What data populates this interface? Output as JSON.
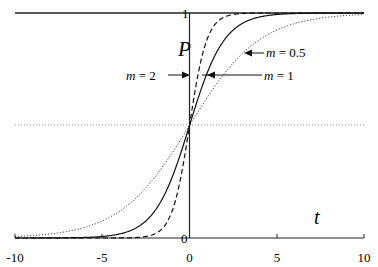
{
  "chart_data": {
    "type": "line",
    "title": "",
    "xlabel": "t",
    "ylabel": "P",
    "xlim": [
      -10,
      10
    ],
    "ylim": [
      0,
      1
    ],
    "x_ticks": [
      "-10",
      "-5",
      "0",
      "5",
      "10"
    ],
    "y_ticks": [
      "0",
      "1"
    ],
    "grid": false,
    "reference_line": {
      "y": 0.5,
      "style": "dotted"
    },
    "function": "P = 1 / (1 + exp(-m t))",
    "series": [
      {
        "name": "m = 0.5",
        "m": 0.5,
        "style": "dotted",
        "x": [
          -10,
          -8,
          -6,
          -4,
          -2,
          0,
          2,
          4,
          6,
          8,
          10
        ],
        "values": [
          0.007,
          0.018,
          0.047,
          0.119,
          0.269,
          0.5,
          0.731,
          0.881,
          0.953,
          0.982,
          0.993
        ]
      },
      {
        "name": "m = 1",
        "m": 1,
        "style": "solid",
        "x": [
          -10,
          -8,
          -6,
          -4,
          -2,
          0,
          2,
          4,
          6,
          8,
          10
        ],
        "values": [
          0.0,
          0.0003,
          0.0025,
          0.018,
          0.119,
          0.5,
          0.881,
          0.982,
          0.9975,
          0.9997,
          1.0
        ]
      },
      {
        "name": "m = 2",
        "m": 2,
        "style": "dashed",
        "x": [
          -10,
          -8,
          -6,
          -4,
          -2,
          0,
          2,
          4,
          6,
          8,
          10
        ],
        "values": [
          0.0,
          0.0,
          0.0,
          0.0003,
          0.018,
          0.5,
          0.982,
          0.9997,
          1.0,
          1.0,
          1.0
        ]
      }
    ],
    "annotations": [
      "m = 0.5",
      "m = 1",
      "m = 2"
    ]
  },
  "labels": {
    "y_axis": "P",
    "x_axis": "t",
    "tick_x": [
      "-10",
      "-5",
      "0",
      "5",
      "10"
    ],
    "tick_y0": "0",
    "tick_y1": "1",
    "ann_m05": "m = 0.5",
    "ann_m1": "m = 1",
    "ann_m2": "m = 2"
  }
}
